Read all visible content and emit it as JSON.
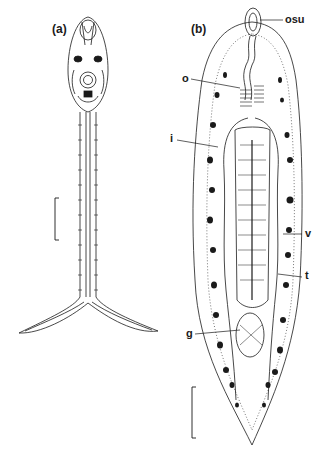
{
  "figure": {
    "panels": [
      {
        "id": "a",
        "label": "(a)"
      },
      {
        "id": "b",
        "label": "(b)"
      }
    ],
    "annotations": [
      {
        "key": "osu",
        "text": "osu"
      },
      {
        "key": "o",
        "text": "o"
      },
      {
        "key": "i",
        "text": "i"
      },
      {
        "key": "v",
        "text": "v"
      },
      {
        "key": "t",
        "text": "t"
      },
      {
        "key": "g",
        "text": "g"
      }
    ],
    "scale_bars": [
      {
        "panel": "a"
      },
      {
        "panel": "b"
      }
    ],
    "colors": {
      "ink": "#1a1a1a",
      "background": "#ffffff",
      "stipple": "#555555"
    }
  }
}
